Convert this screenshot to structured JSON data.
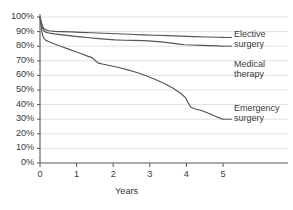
{
  "chart_data": {
    "type": "line",
    "title": "",
    "subtitle": "",
    "xlabel": "Years",
    "ylabel": "",
    "xlim": [
      0,
      5
    ],
    "ylim": [
      0,
      1.0
    ],
    "grid": true,
    "grid_axis": "y",
    "legend_position": "right-inline-labels",
    "line_color": "#555555",
    "grid_color": "#d9d9d9",
    "axis_color": "#595959",
    "background_color": "#ffffff",
    "x_ticks": [
      0,
      1,
      2,
      3,
      4,
      5
    ],
    "x_tick_labels": [
      "0",
      "1",
      "2",
      "3",
      "4",
      "5"
    ],
    "y_ticks": [
      0,
      10,
      20,
      30,
      40,
      50,
      60,
      70,
      80,
      90,
      100
    ],
    "y_tick_labels": [
      "0%",
      "10%",
      "20%",
      "30%",
      "40%",
      "50%",
      "60%",
      "70%",
      "80%",
      "90%",
      "100%"
    ],
    "series": [
      {
        "name": "Elective surgery",
        "label_line1": "Elective",
        "label_line2": "surgery",
        "end_value": 86,
        "points": [
          [
            0.0,
            100
          ],
          [
            0.03,
            97
          ],
          [
            0.06,
            94.2
          ],
          [
            0.1,
            92.3
          ],
          [
            0.16,
            91.2
          ],
          [
            0.25,
            90.6
          ],
          [
            0.4,
            90.2
          ],
          [
            0.6,
            90.0
          ],
          [
            0.85,
            89.8
          ],
          [
            1.1,
            89.5
          ],
          [
            1.4,
            89.2
          ],
          [
            1.75,
            88.9
          ],
          [
            2.1,
            88.5
          ],
          [
            2.45,
            88.2
          ],
          [
            2.8,
            87.8
          ],
          [
            3.15,
            87.5
          ],
          [
            3.5,
            87.2
          ],
          [
            3.85,
            86.9
          ],
          [
            4.2,
            86.6
          ],
          [
            4.55,
            86.3
          ],
          [
            4.85,
            86.1
          ],
          [
            5.0,
            86.0
          ]
        ]
      },
      {
        "name": "Medical therapy",
        "label_line1": "Medical",
        "label_line2": "therapy",
        "end_value": 80,
        "points": [
          [
            0.0,
            100
          ],
          [
            0.03,
            96.5
          ],
          [
            0.06,
            93.0
          ],
          [
            0.1,
            90.8
          ],
          [
            0.16,
            89.6
          ],
          [
            0.25,
            89.0
          ],
          [
            0.4,
            88.4
          ],
          [
            0.6,
            87.8
          ],
          [
            0.85,
            87.1
          ],
          [
            1.1,
            86.4
          ],
          [
            1.35,
            85.8
          ],
          [
            1.6,
            85.2
          ],
          [
            1.85,
            84.7
          ],
          [
            2.05,
            84.3
          ],
          [
            2.3,
            84.1
          ],
          [
            2.55,
            84.0
          ],
          [
            2.8,
            83.8
          ],
          [
            3.05,
            83.5
          ],
          [
            3.3,
            83.0
          ],
          [
            3.55,
            82.3
          ],
          [
            3.75,
            81.6
          ],
          [
            3.95,
            81.0
          ],
          [
            4.15,
            80.8
          ],
          [
            4.4,
            80.6
          ],
          [
            4.65,
            80.4
          ],
          [
            4.85,
            80.2
          ],
          [
            5.0,
            80.0
          ]
        ]
      },
      {
        "name": "Emergency surgery",
        "label_line1": "Emergency",
        "label_line2": "surgery",
        "end_value": 30,
        "points": [
          [
            0.0,
            100
          ],
          [
            0.03,
            94.0
          ],
          [
            0.06,
            88.5
          ],
          [
            0.1,
            85.5
          ],
          [
            0.16,
            84.0
          ],
          [
            0.25,
            83.0
          ],
          [
            0.4,
            81.5
          ],
          [
            0.6,
            79.6
          ],
          [
            0.8,
            77.8
          ],
          [
            1.0,
            76.0
          ],
          [
            1.15,
            74.6
          ],
          [
            1.3,
            73.2
          ],
          [
            1.42,
            72.2
          ],
          [
            1.5,
            70.4
          ],
          [
            1.58,
            68.6
          ],
          [
            1.7,
            67.8
          ],
          [
            1.9,
            66.8
          ],
          [
            2.15,
            65.4
          ],
          [
            2.4,
            63.8
          ],
          [
            2.65,
            62.0
          ],
          [
            2.9,
            59.8
          ],
          [
            3.15,
            57.2
          ],
          [
            3.4,
            54.4
          ],
          [
            3.65,
            51.0
          ],
          [
            3.85,
            47.6
          ],
          [
            3.98,
            44.6
          ],
          [
            4.05,
            41.2
          ],
          [
            4.12,
            38.2
          ],
          [
            4.25,
            37.0
          ],
          [
            4.45,
            35.6
          ],
          [
            4.65,
            33.6
          ],
          [
            4.85,
            31.4
          ],
          [
            5.0,
            30.0
          ]
        ]
      }
    ]
  }
}
